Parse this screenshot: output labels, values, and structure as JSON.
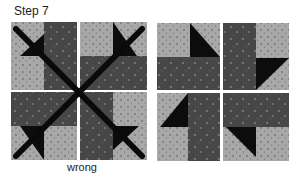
{
  "step_label": "Step 7",
  "wrong_label": "wrong",
  "colors": {
    "light_fabric": "#a8a8a8",
    "dark_fabric": "#4a4a4a",
    "triangle": "#0c0c0c",
    "cross_mark": "#0a0a0a",
    "background": "#ffffff"
  },
  "blocks": [
    {
      "name": "wrong-arrangement",
      "crossed_out": true,
      "caption": "wrong"
    },
    {
      "name": "correct-arrangement",
      "crossed_out": false
    }
  ]
}
